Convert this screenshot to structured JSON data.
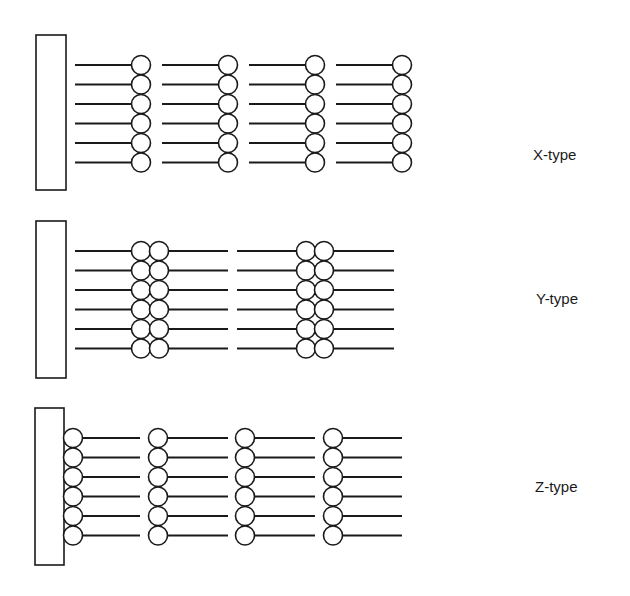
{
  "diagram": {
    "stroke_color": "#1a1a1a",
    "background": "#ffffff",
    "panels": [
      {
        "id": "x-type",
        "label": "X-type",
        "label_pos": [
          533,
          160
        ],
        "substrate": {
          "x": 36,
          "y": 35,
          "w": 30,
          "h": 155
        },
        "rows_y": [
          65,
          84.5,
          104,
          123.5,
          143,
          162.5
        ],
        "radius": 9.5,
        "arrangement": "head-tail-head-tail",
        "units": [
          {
            "line": [
              75,
              131.5
            ],
            "circles": [
              141
            ]
          },
          {
            "line": [
              162,
              218.5
            ],
            "circles": [
              228
            ]
          },
          {
            "line": [
              249,
              305.5
            ],
            "circles": [
              315
            ]
          },
          {
            "line": [
              336,
              392.5
            ],
            "circles": [
              402
            ]
          }
        ]
      },
      {
        "id": "y-type",
        "label": "Y-type",
        "label_pos": [
          536,
          304
        ],
        "substrate": {
          "x": 36,
          "y": 221,
          "w": 30,
          "h": 157
        },
        "rows_y": [
          251,
          270.5,
          290,
          309.5,
          329,
          348.5
        ],
        "radius": 9.5,
        "arrangement": "tail-head-head-tail",
        "units": [
          {
            "line": [
              75,
              131.5
            ],
            "circles": []
          },
          {
            "line": [
              168.5,
              228
            ],
            "circles": [
              141,
              159
            ]
          },
          {
            "line": [
              237,
              296.5
            ],
            "circles": []
          },
          {
            "line": [
              333.5,
              394
            ],
            "circles": [
              306,
              324
            ]
          }
        ]
      },
      {
        "id": "z-type",
        "label": "Z-type",
        "label_pos": [
          535,
          492
        ],
        "substrate": {
          "x": 35,
          "y": 408,
          "w": 29,
          "h": 157
        },
        "rows_y": [
          438,
          457.5,
          477,
          496.5,
          516,
          535.5
        ],
        "radius": 9.5,
        "arrangement": "head-tail-head-tail",
        "units": [
          {
            "line": [
              82.5,
              140
            ],
            "circles": [
              73
            ]
          },
          {
            "line": [
              167.5,
              228
            ],
            "circles": [
              158
            ]
          },
          {
            "line": [
              254.5,
              315
            ],
            "circles": [
              245
            ]
          },
          {
            "line": [
              342.5,
              402
            ],
            "circles": [
              333
            ]
          }
        ]
      }
    ]
  }
}
